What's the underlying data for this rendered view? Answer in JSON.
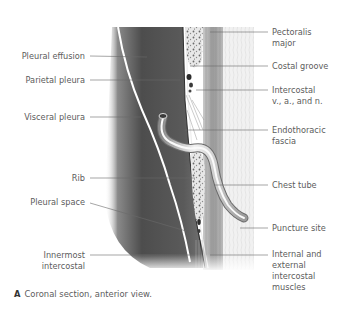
{
  "figure": {
    "caption_letter": "A",
    "caption_text": "Coronal section, anterior view.",
    "left_labels": [
      {
        "id": "pleural-effusion",
        "lines": [
          "Pleural effusion"
        ]
      },
      {
        "id": "parietal-pleura",
        "lines": [
          "Parietal pleura"
        ]
      },
      {
        "id": "visceral-pleura",
        "lines": [
          "Visceral pleura"
        ]
      },
      {
        "id": "rib",
        "lines": [
          "Rib"
        ]
      },
      {
        "id": "pleural-space",
        "lines": [
          "Pleural space"
        ]
      },
      {
        "id": "innermost-intercostal",
        "lines": [
          "Innermost",
          "intercostal"
        ]
      }
    ],
    "right_labels": [
      {
        "id": "pectoralis-major",
        "lines": [
          "Pectoralis",
          "major"
        ]
      },
      {
        "id": "costal-groove",
        "lines": [
          "Costal groove"
        ]
      },
      {
        "id": "intercostal-vessels-nerve",
        "lines": [
          "Intercostal",
          "v., a.,  and n."
        ]
      },
      {
        "id": "endothoracic-fascia",
        "lines": [
          "Endothoracic",
          "fascia"
        ]
      },
      {
        "id": "chest-tube",
        "lines": [
          "Chest tube"
        ]
      },
      {
        "id": "puncture-site",
        "lines": [
          "Puncture site"
        ]
      },
      {
        "id": "intercostal-muscles",
        "lines": [
          "Internal and",
          "external",
          "intercostal",
          "muscles"
        ]
      }
    ],
    "colors": {
      "label_text": "#5c5c5c",
      "leader_line": "#6a6a6a",
      "effusion_dark": "#4a4a4a",
      "background": "#ffffff"
    }
  }
}
